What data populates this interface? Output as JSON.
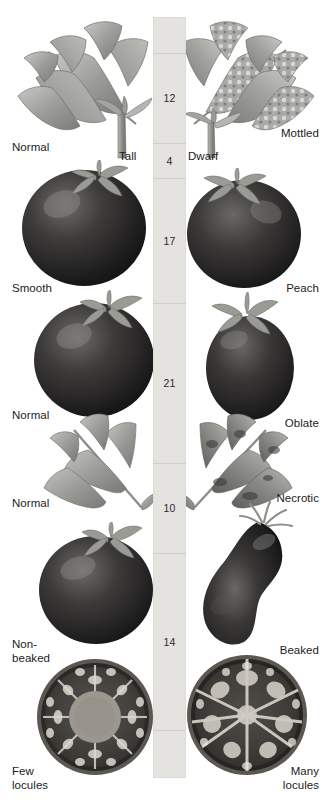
{
  "figure": {
    "background_color": "#ffffff",
    "bar_color": "#e4e3df",
    "text_color": "#1c1c1c"
  },
  "chromosome_map": {
    "name": "linkage-map-bar",
    "orientation": "vertical",
    "unit": "map units (centimorgans)",
    "segments": [
      {
        "label": "",
        "distance": null,
        "top": 0,
        "height": 36
      },
      {
        "label": "12",
        "distance": 12,
        "top": 36,
        "height": 90
      },
      {
        "label": "4",
        "distance": 4,
        "top": 126,
        "height": 35
      },
      {
        "label": "17",
        "distance": 17,
        "top": 161,
        "height": 125
      },
      {
        "label": "21",
        "distance": 21,
        "top": 286,
        "height": 160
      },
      {
        "label": "10",
        "distance": 10,
        "top": 446,
        "height": 90
      },
      {
        "label": "14",
        "distance": 14,
        "top": 536,
        "height": 177
      },
      {
        "label": "",
        "distance": null,
        "top": 713,
        "height": 48
      }
    ]
  },
  "trait_pairs": [
    {
      "gene_row": 1,
      "left": {
        "label": "Normal",
        "description": "normal broad compound leaf"
      },
      "right": {
        "label": "Mottled",
        "description": "mottled variegated leaf"
      }
    },
    {
      "gene_row": 2,
      "left": {
        "label": "Tall",
        "description": "tall plant stem with shoot"
      },
      "right": {
        "label": "Dwarf",
        "description": "dwarf plant stem with shoot"
      }
    },
    {
      "gene_row": 3,
      "left": {
        "label": "Smooth",
        "description": "smooth skinned round fruit"
      },
      "right": {
        "label": "Peach",
        "description": "peach fuzzy skinned fruit"
      }
    },
    {
      "gene_row": 4,
      "left": {
        "label": "Normal",
        "description": "normal round fruit shape"
      },
      "right": {
        "label": "Oblate",
        "description": "oblate elongated fruit shape"
      }
    },
    {
      "gene_row": 5,
      "left": {
        "label": "Normal",
        "description": "normal healthy leaflets"
      },
      "right": {
        "label": "Necrotic",
        "description": "necrotic withered leaflets"
      }
    },
    {
      "gene_row": 6,
      "left": {
        "label": "Non-\nbeaked",
        "description": "non-beaked round fruit"
      },
      "right": {
        "label": "Beaked",
        "description": "beaked pear shaped fruit"
      }
    },
    {
      "gene_row": 7,
      "left": {
        "label": "Few\nlocules",
        "description": "cross section, few locules"
      },
      "right": {
        "label": "Many\nlocules",
        "description": "cross section, many locules"
      }
    }
  ]
}
